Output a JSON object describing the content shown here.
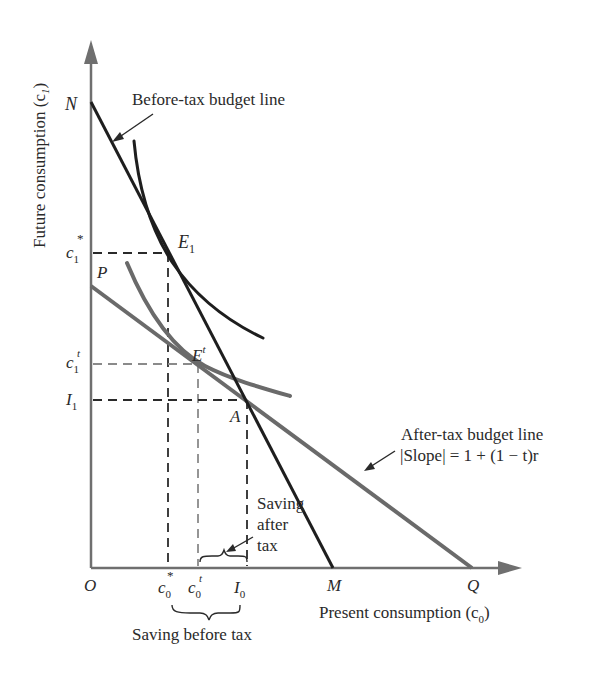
{
  "diagram": {
    "axes": {
      "y_label": "Future consumption (c",
      "y_label_sub": "1",
      "y_label_close": ")",
      "x_label": "Present consumption (c",
      "x_label_sub": "0",
      "x_label_close": ")",
      "origin": "O"
    },
    "points": {
      "N": "N",
      "P": "P",
      "M": "M",
      "Q": "Q",
      "E1": "E",
      "E1_sub": "1",
      "Et": "E",
      "Et_sup": "t",
      "A": "A"
    },
    "y_ticks": {
      "c1_star": "c",
      "c1_star_sub": "1",
      "c1_star_sup": "*",
      "c1_t": "c",
      "c1_t_sub": "1",
      "c1_t_sup": "t",
      "I1": "I",
      "I1_sub": "1"
    },
    "x_ticks": {
      "c0_star": "c",
      "c0_star_sub": "0",
      "c0_star_sup": "*",
      "c0_t": "c",
      "c0_t_sub": "0",
      "c0_t_sup": "t",
      "I0": "I",
      "I0_sub": "0"
    },
    "annotations": {
      "before_tax_line": "Before-tax budget line",
      "after_tax_line": "After-tax budget line",
      "after_tax_slope": "|Slope| = 1 + (1 − t)r",
      "saving_after_tax_1": "Saving",
      "saving_after_tax_2": "after",
      "saving_after_tax_3": "tax",
      "saving_before_tax": "Saving before tax"
    },
    "colors": {
      "black_line": "#1e1e1e",
      "gray_line": "#6a6a6a",
      "axis": "#6f6f6f",
      "text": "#2a2a2a"
    }
  }
}
